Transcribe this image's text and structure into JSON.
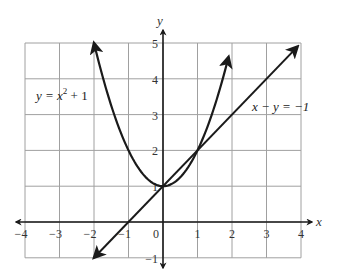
{
  "chart_data": {
    "type": "line",
    "title": "",
    "xlabel": "x",
    "ylabel": "y",
    "xlim": [
      -4,
      4
    ],
    "ylim": [
      -1,
      5
    ],
    "grid": true,
    "x_ticks": [
      "-4",
      "-3",
      "-2",
      "-1",
      "0",
      "1",
      "2",
      "3",
      "4"
    ],
    "y_ticks": [
      "-1",
      "1",
      "2",
      "3",
      "4",
      "5"
    ],
    "series": [
      {
        "name": "y = x^2 + 1",
        "label_text": "y = x² + 1",
        "kind": "parabola",
        "equation": "y = x^2 + 1",
        "x_range": [
          -2,
          2
        ],
        "points": [
          [
            -2,
            5
          ],
          [
            -1,
            2
          ],
          [
            0,
            1
          ],
          [
            1,
            2
          ],
          [
            1.9,
            4.6
          ]
        ],
        "arrows": "both"
      },
      {
        "name": "x - y = -1",
        "label_text": "x − y = −1",
        "kind": "line",
        "equation": "y = x + 1",
        "points": [
          [
            -2,
            -1
          ],
          [
            -1,
            0
          ],
          [
            0,
            1
          ],
          [
            1,
            2
          ],
          [
            3.9,
            4.9
          ]
        ],
        "arrows": "both"
      }
    ]
  },
  "labels": {
    "x_axis": "x",
    "y_axis": "y",
    "origin": "0",
    "parabola_label_pre": "y = x",
    "parabola_label_exp": "2",
    "parabola_label_post": " + 1",
    "line_label": "x − y = −1"
  },
  "ticks": {
    "x": [
      {
        "value": -4,
        "text": "−4"
      },
      {
        "value": -3,
        "text": "−3"
      },
      {
        "value": -2,
        "text": "−2"
      },
      {
        "value": -1,
        "text": "−1"
      },
      {
        "value": 1,
        "text": "1"
      },
      {
        "value": 2,
        "text": "2"
      },
      {
        "value": 3,
        "text": "3"
      },
      {
        "value": 4,
        "text": "4"
      }
    ],
    "y": [
      {
        "value": -1,
        "text": "−1"
      },
      {
        "value": 1,
        "text": "1"
      },
      {
        "value": 2,
        "text": "2"
      },
      {
        "value": 3,
        "text": "3"
      },
      {
        "value": 4,
        "text": "4"
      },
      {
        "value": 5,
        "text": "5"
      }
    ]
  },
  "colors": {
    "grid": "#9a9a9a",
    "axis": "#1a1a1a",
    "curve": "#1a1a1a",
    "text": "#333333"
  }
}
